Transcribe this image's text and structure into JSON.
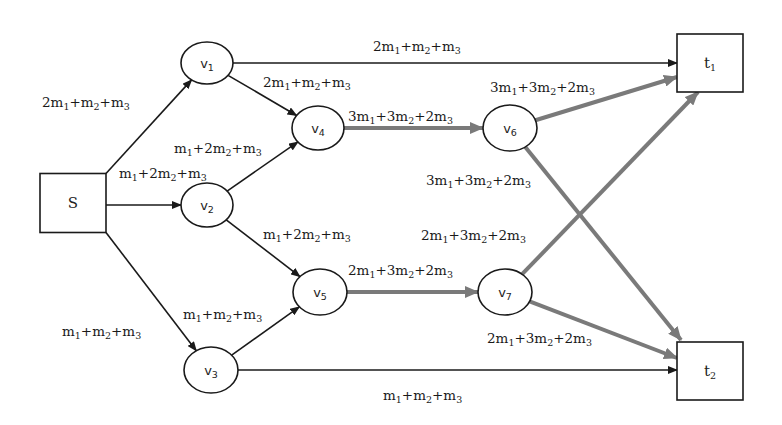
{
  "diagram": {
    "colors": {
      "thin_edge": "#1a1a1a",
      "thick_edge": "#7a7a7a",
      "node_stroke": "#1a1a1a",
      "background": "#ffffff"
    },
    "nodes": [
      {
        "id": "S",
        "shape": "box",
        "label": "S",
        "sub": "",
        "cx": 73,
        "cy": 203,
        "w": 66,
        "h": 59
      },
      {
        "id": "v1",
        "shape": "ellipse",
        "label": "v",
        "sub": "1",
        "cx": 207,
        "cy": 63,
        "rx": 26,
        "ry": 21
      },
      {
        "id": "v2",
        "shape": "ellipse",
        "label": "v",
        "sub": "2",
        "cx": 207,
        "cy": 205,
        "rx": 26,
        "ry": 22
      },
      {
        "id": "v3",
        "shape": "ellipse",
        "label": "v",
        "sub": "3",
        "cx": 211,
        "cy": 370,
        "rx": 27,
        "ry": 23
      },
      {
        "id": "v4",
        "shape": "ellipse",
        "label": "v",
        "sub": "4",
        "cx": 318,
        "cy": 128,
        "rx": 26,
        "ry": 22
      },
      {
        "id": "v5",
        "shape": "ellipse",
        "label": "v",
        "sub": "5",
        "cx": 320,
        "cy": 292,
        "rx": 27,
        "ry": 23
      },
      {
        "id": "v6",
        "shape": "ellipse",
        "label": "v",
        "sub": "6",
        "cx": 510,
        "cy": 128,
        "rx": 27,
        "ry": 23
      },
      {
        "id": "v7",
        "shape": "ellipse",
        "label": "v",
        "sub": "7",
        "cx": 505,
        "cy": 292,
        "rx": 27,
        "ry": 23
      },
      {
        "id": "t1",
        "shape": "box",
        "label": "t",
        "sub": "1",
        "cx": 710,
        "cy": 63,
        "w": 66,
        "h": 58
      },
      {
        "id": "t2",
        "shape": "box",
        "label": "t",
        "sub": "2",
        "cx": 710,
        "cy": 371,
        "w": 66,
        "h": 58
      }
    ],
    "edges": [
      {
        "from": "S",
        "to": "v1",
        "label": "2m1+m2+m3",
        "thick": false
      },
      {
        "from": "S",
        "to": "v2",
        "label": "m1+2m2+m3",
        "thick": false
      },
      {
        "from": "S",
        "to": "v3",
        "label": "m1+m2+m3",
        "thick": false
      },
      {
        "from": "v1",
        "to": "t1",
        "label": "2m1+m2+m3",
        "thick": false
      },
      {
        "from": "v1",
        "to": "v4",
        "label": "2m1+m2+m3",
        "thick": false
      },
      {
        "from": "v2",
        "to": "v4",
        "label": "m1+2m2+m3",
        "thick": false
      },
      {
        "from": "v2",
        "to": "v5",
        "label": "m1+2m2+m3",
        "thick": false
      },
      {
        "from": "v3",
        "to": "v5",
        "label": "m1+m2+m3",
        "thick": false
      },
      {
        "from": "v3",
        "to": "t2",
        "label": "m1+m2+m3",
        "thick": false
      },
      {
        "from": "v4",
        "to": "v6",
        "label": "3m1+3m2+2m3",
        "thick": true
      },
      {
        "from": "v5",
        "to": "v7",
        "label": "2m1+3m2+2m3",
        "thick": true
      },
      {
        "from": "v6",
        "to": "t1",
        "label": "3m1+3m2+2m3",
        "thick": true
      },
      {
        "from": "v6",
        "to": "t2",
        "label": "3m1+3m2+2m3",
        "thick": true
      },
      {
        "from": "v7",
        "to": "t1",
        "label": "2m1+3m2+2m3",
        "thick": true
      },
      {
        "from": "v7",
        "to": "t2",
        "label": "2m1+3m2+2m3",
        "thick": true
      }
    ],
    "edge_labels": [
      {
        "text": "2m1+m2+m3",
        "x": 42,
        "y": 107
      },
      {
        "text": "m1+2m2+m3",
        "x": 119,
        "y": 178
      },
      {
        "text": "m1+m2+m3",
        "x": 62,
        "y": 336
      },
      {
        "text": "2m1+m2+m3",
        "x": 373,
        "y": 51
      },
      {
        "text": "2m1+m2+m3",
        "x": 263,
        "y": 87
      },
      {
        "text": "m1+2m2+m3",
        "x": 174,
        "y": 153
      },
      {
        "text": "m1+2m2+m3",
        "x": 263,
        "y": 239
      },
      {
        "text": "m1+m2+m3",
        "x": 183,
        "y": 319
      },
      {
        "text": "m1+m2+m3",
        "x": 383,
        "y": 400
      },
      {
        "text": "3m1+3m2+2m3",
        "x": 348,
        "y": 121
      },
      {
        "text": "2m1+3m2+2m3",
        "x": 348,
        "y": 275
      },
      {
        "text": "3m1+3m2+2m3",
        "x": 490,
        "y": 92
      },
      {
        "text": "3m1+3m2+2m3",
        "x": 426,
        "y": 185
      },
      {
        "text": "2m1+3m2+2m3",
        "x": 421,
        "y": 240
      },
      {
        "text": "2m1+3m2+2m3",
        "x": 487,
        "y": 343
      }
    ]
  }
}
